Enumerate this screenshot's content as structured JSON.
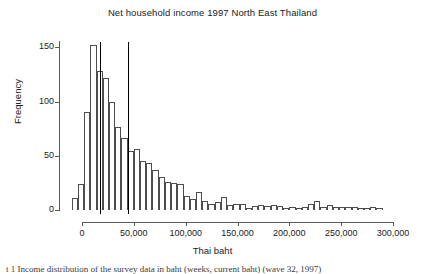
{
  "figure": {
    "title": "Net household income 1997 North East Thailand",
    "xlabel": "Thai baht",
    "ylabel": "Frequency",
    "caption": "t 1 Income distribution of the survey data in baht (weeks, current baht) (wave 32, 1997)"
  },
  "chart_data": {
    "type": "bar",
    "title": "Net household income 1997 North East Thailand",
    "xlabel": "Thai baht",
    "ylabel": "Frequency",
    "xlim": [
      -12000,
      300000
    ],
    "ylim": [
      0,
      155
    ],
    "grid": false,
    "legend": null,
    "bin_width": 6000,
    "xticks": [
      0,
      50000,
      100000,
      150000,
      200000,
      250000,
      300000
    ],
    "xticklabels": [
      "0",
      "50,000",
      "100,000",
      "150,000",
      "200,000",
      "250,000",
      "300,000"
    ],
    "yticks": [
      0,
      50,
      100,
      150
    ],
    "yticklabels": [
      "0",
      "50",
      "100",
      "150"
    ],
    "bin_starts": [
      -10000,
      -4000,
      2000,
      8000,
      14000,
      20000,
      26000,
      32000,
      38000,
      44000,
      50000,
      56000,
      62000,
      68000,
      74000,
      80000,
      86000,
      92000,
      98000,
      104000,
      110000,
      116000,
      122000,
      128000,
      134000,
      140000,
      146000,
      152000,
      158000,
      164000,
      170000,
      176000,
      182000,
      188000,
      194000,
      200000,
      206000,
      212000,
      218000,
      224000,
      230000,
      236000,
      242000,
      248000,
      254000,
      260000,
      266000,
      272000,
      278000,
      284000
    ],
    "values": [
      11,
      24,
      90,
      152,
      128,
      122,
      100,
      77,
      66,
      54,
      56,
      45,
      43,
      37,
      30,
      26,
      25,
      24,
      13,
      10,
      17,
      8,
      6,
      7,
      12,
      5,
      6,
      6,
      2,
      4,
      5,
      4,
      5,
      4,
      2,
      3,
      2,
      3,
      6,
      8,
      3,
      5,
      3,
      3,
      3,
      3,
      2,
      2,
      3,
      2
    ],
    "reference_lines": [
      {
        "name": "median-line",
        "x": 17000,
        "color": "#000000"
      },
      {
        "name": "mean-line",
        "x": 44000,
        "color": "#000000"
      }
    ],
    "colors": {
      "bar_fill": "#ffffff",
      "bar_edge": "#4d4d4d",
      "axis": "#5a5a5a",
      "text": "#222222"
    }
  }
}
